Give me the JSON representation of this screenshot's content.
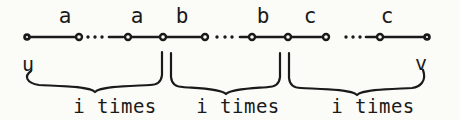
{
  "figure": {
    "type": "labeled-path-diagram",
    "colors": {
      "ink": "#1a1a1a",
      "paper": "#fbfbf8"
    },
    "path": {
      "y": 37,
      "node_x": [
        27,
        79,
        128,
        163,
        205,
        252,
        288,
        326,
        380,
        427
      ],
      "endpoint_indices": [
        0,
        9
      ],
      "edges": [
        [
          0,
          1
        ],
        [
          2,
          3
        ],
        [
          3,
          4
        ],
        [
          5,
          6
        ],
        [
          6,
          7
        ],
        [
          8,
          9
        ]
      ],
      "ellipses": [
        {
          "dots": [
            88,
            95,
            102
          ],
          "dash": [
            109,
            123
          ]
        },
        {
          "dots": [
            217,
            225,
            232
          ],
          "dash": [
            240,
            248
          ]
        },
        {
          "dots": [
            346,
            353,
            360
          ],
          "dash": [
            366,
            376
          ]
        }
      ]
    },
    "edge_labels": [
      {
        "text": "a",
        "x": 65
      },
      {
        "text": "a",
        "x": 137
      },
      {
        "text": "b",
        "x": 182
      },
      {
        "text": "b",
        "x": 263
      },
      {
        "text": "c",
        "x": 310
      },
      {
        "text": "c",
        "x": 387
      }
    ],
    "edge_label_y": 23,
    "endpoint_labels": [
      {
        "text": "u",
        "x": 28,
        "y": 71
      },
      {
        "text": "v",
        "x": 421,
        "y": 70
      }
    ],
    "braces": [
      {
        "x1": 28,
        "x2": 162,
        "run_y": 85,
        "cusp_x": 95,
        "cusp_y": 92,
        "top_y": 52,
        "left_end": "curl",
        "right_end": "tail",
        "label": "i times",
        "label_x": 115
      },
      {
        "x1": 171,
        "x2": 280,
        "run_y": 87,
        "cusp_x": 226,
        "cusp_y": 94,
        "top_y": 53,
        "left_end": "tail",
        "right_end": "tail",
        "label": "i times",
        "label_x": 238
      },
      {
        "x1": 289,
        "x2": 424,
        "run_y": 88,
        "cusp_x": 357,
        "cusp_y": 95,
        "top_y": 53,
        "left_end": "tail",
        "right_end": "curl",
        "label": "i times",
        "label_x": 373
      }
    ],
    "brace_label_y": 113
  }
}
